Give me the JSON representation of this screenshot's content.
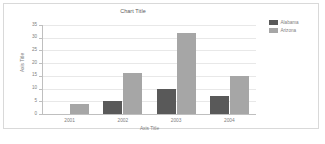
{
  "chart_data": {
    "type": "bar",
    "title": "Chart Title",
    "xlabel": "Axis Title",
    "ylabel": "Axis Title",
    "categories": [
      "2001",
      "2002",
      "2003",
      "2004"
    ],
    "series": [
      {
        "name": "Alabama",
        "color": "#595959",
        "values": [
          0,
          5,
          10,
          7
        ]
      },
      {
        "name": "Arizona",
        "color": "#a6a6a6",
        "values": [
          4,
          16,
          32,
          15
        ]
      }
    ],
    "ylim": [
      0,
      35
    ],
    "yticks": [
      0,
      5,
      10,
      15,
      20,
      25,
      30,
      35
    ],
    "grid": "horizontal",
    "legend_position": "top-right"
  },
  "legend": {
    "items": [
      {
        "label": "Alabama"
      },
      {
        "label": "Arizona"
      }
    ]
  }
}
